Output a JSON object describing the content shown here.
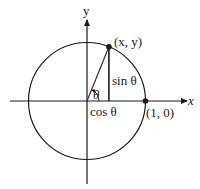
{
  "diagram": {
    "type": "unit-circle",
    "labels": {
      "y_axis": "y",
      "x_axis": "x",
      "point_on_circle": "(x, y)",
      "point_on_axis": "(1, 0)",
      "sine": "sin θ",
      "cosine": "cos θ",
      "angle": "θ"
    },
    "angle_degrees": 68,
    "colors": {
      "stroke": "#1a1a1a",
      "background": "#ffffff"
    }
  }
}
